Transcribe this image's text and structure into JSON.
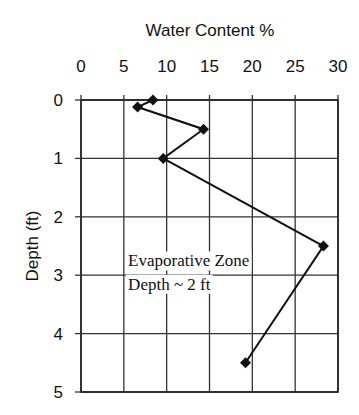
{
  "chart_data": {
    "type": "line",
    "title": "Water Content %",
    "xlabel": "Water Content %",
    "ylabel": "Depth (ft)",
    "x_axis_position": "top",
    "y_axis_inverted": true,
    "xlim": [
      0,
      30
    ],
    "ylim": [
      0,
      5
    ],
    "x_ticks": [
      0,
      5,
      10,
      15,
      20,
      25,
      30
    ],
    "y_ticks": [
      0,
      1,
      2,
      3,
      4,
      5
    ],
    "grid": true,
    "legend": null,
    "marker": "diamond",
    "series": [
      {
        "name": "Water Content",
        "points": [
          {
            "x": 8.4,
            "y": 0.0
          },
          {
            "x": 6.6,
            "y": 0.12
          },
          {
            "x": 14.3,
            "y": 0.5
          },
          {
            "x": 9.6,
            "y": 1.0
          },
          {
            "x": 28.3,
            "y": 2.5
          },
          {
            "x": 19.2,
            "y": 4.5
          }
        ]
      }
    ],
    "annotations": [
      {
        "text": "Evaporative Zone",
        "x": 5.5,
        "y": 2.85
      },
      {
        "text": "Depth ~ 2 ft",
        "x": 5.5,
        "y": 3.25
      }
    ]
  },
  "colors": {
    "line": "#111111",
    "grid": "#333333",
    "text": "#111111",
    "background": "#ffffff"
  }
}
